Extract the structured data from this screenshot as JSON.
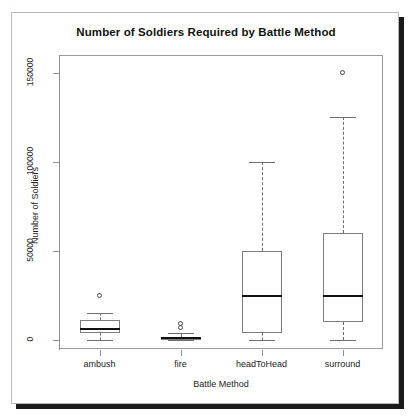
{
  "top_cut_text": "plot of chunk unnamed-chunk-7",
  "chart_data": {
    "type": "box",
    "title": "Number of Soldiers Required by Battle Method",
    "xlabel": "Battle Method",
    "ylabel": "Number of Soldiers",
    "categories": [
      "ambush",
      "fire",
      "headToHead",
      "surround"
    ],
    "ylim": [
      -5000,
      160000
    ],
    "ytick_values": [
      0,
      50000,
      100000,
      150000
    ],
    "ytick_labels": [
      "0",
      "50000",
      "100000",
      "150000"
    ],
    "grid": false,
    "legend": false,
    "boxes": [
      {
        "category": "ambush",
        "whisker_low": 0,
        "q1": 4000,
        "median": 6500,
        "q3": 11000,
        "whisker_high": 15000,
        "outliers": [
          25000
        ]
      },
      {
        "category": "fire",
        "whisker_low": 0,
        "q1": 0,
        "median": 900,
        "q3": 2000,
        "whisker_high": 4000,
        "outliers": [
          7000,
          9500
        ]
      },
      {
        "category": "headToHead",
        "whisker_low": 0,
        "q1": 4000,
        "median": 25000,
        "q3": 50000,
        "whisker_high": 100000,
        "outliers": []
      },
      {
        "category": "surround",
        "whisker_low": 0,
        "q1": 10000,
        "median": 25000,
        "q3": 60000,
        "whisker_high": 125000,
        "outliers": [
          150000
        ]
      }
    ]
  },
  "colors": {
    "panel_border": "#9a9a9a",
    "box_border": "#7d7d7d",
    "median": "#111111",
    "whisker": "#6e6e6e",
    "outlier": "#4a4a4a",
    "background": "#ffffff",
    "text": "#222222",
    "shadow": "#1a1a1a"
  }
}
